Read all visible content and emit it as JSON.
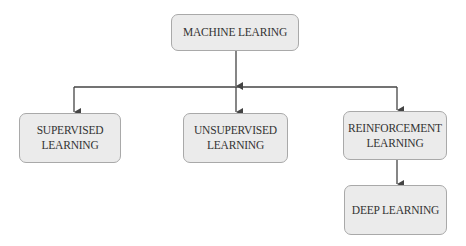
{
  "diagram": {
    "type": "tree",
    "nodes": [
      {
        "id": "root",
        "label": "MACHINE LEARING"
      },
      {
        "id": "supervised",
        "label": "SUPERVISED\nLEARNING"
      },
      {
        "id": "unsupervised",
        "label": "UNSUPERVISED\nLEARNING"
      },
      {
        "id": "reinforcement",
        "label": "REINFORCEMENT\nLEARNING"
      },
      {
        "id": "deep",
        "label": "DEEP LEARNING"
      }
    ],
    "edges": [
      {
        "from": "root",
        "to": "supervised"
      },
      {
        "from": "root",
        "to": "unsupervised"
      },
      {
        "from": "root",
        "to": "reinforcement"
      },
      {
        "from": "reinforcement",
        "to": "deep"
      }
    ],
    "colors": {
      "node_fill": "#ebebeb",
      "node_border": "#a9a9a9",
      "edge": "#444444",
      "text": "#333333"
    }
  }
}
